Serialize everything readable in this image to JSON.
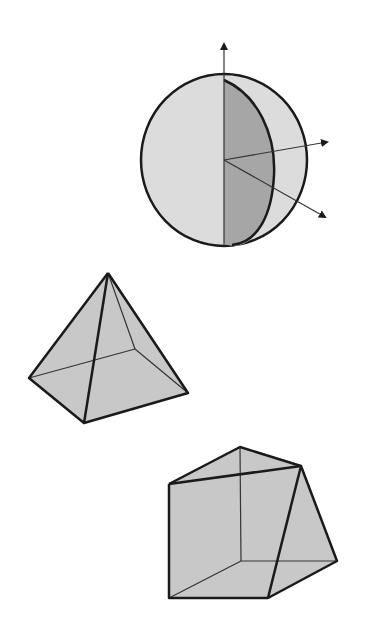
{
  "figure": {
    "width": 367,
    "height": 623,
    "colors": {
      "background": "#ffffff",
      "stroke": "#1a1a1a",
      "thin_stroke": "#333333",
      "light_fill": "#dcdcdc",
      "face_fill": "#c8c8c8",
      "dark_fill": "#a6a6a6"
    },
    "shapes": [
      {
        "name": "sphere",
        "description": "sphere with shaded hemisphere slice and three axis arrows"
      },
      {
        "name": "square-pyramid",
        "description": "square pyramid with hidden edges"
      },
      {
        "name": "triangular-prism",
        "description": "triangular prism with hidden edges"
      }
    ]
  }
}
